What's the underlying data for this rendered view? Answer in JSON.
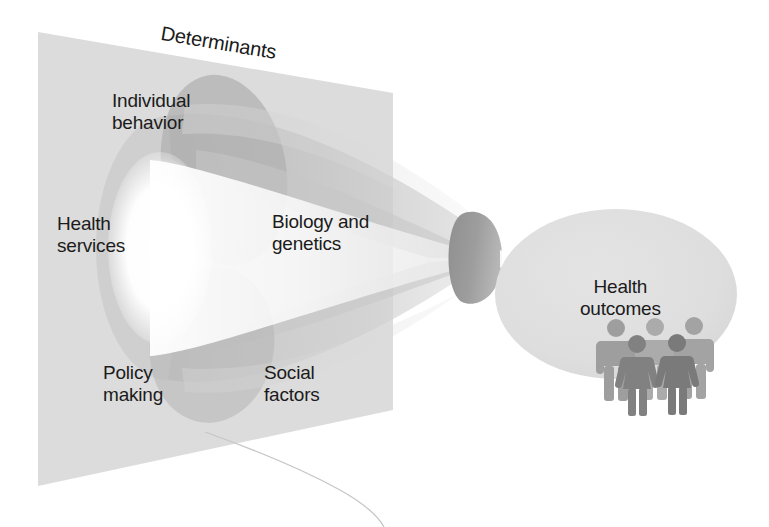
{
  "figure": {
    "name": "determinants-of-health-funnel-diagram",
    "background_color": "#ffffff"
  },
  "plane": {
    "label": "Determinants",
    "fill_color": "#dcdcdc",
    "corners": {
      "top_left": "38,32",
      "top_right": "393,93",
      "bottom_right": "393,410",
      "bottom_left": "38,486"
    }
  },
  "determinant_labels": [
    {
      "id": "individual-behavior",
      "text": "Individual\nbehavior"
    },
    {
      "id": "health-services",
      "text": "Health\nservices"
    },
    {
      "id": "biology-and-genetics",
      "text": "Biology and\ngenetics"
    },
    {
      "id": "policy-making",
      "text": "Policy\nmaking"
    },
    {
      "id": "social-factors",
      "text": "Social\nfactors"
    }
  ],
  "outcome": {
    "label": "Health\noutcomes",
    "oval_fill_color": "#dedede",
    "people_count": 5,
    "people_colors": {
      "back_figures": "#a8a8a8",
      "front_figures": "#878787"
    }
  },
  "funnel": {
    "cone_fill_color": "#cfcfcf",
    "cone_shadow_color": "#b4b4b4",
    "tip_fill_color": "#9d9d9d",
    "highlight_color": "#ffffff",
    "direction": "left-wide-to-right-narrow"
  },
  "annotations": {
    "hairline_crease_color": "#c8c8c8"
  }
}
